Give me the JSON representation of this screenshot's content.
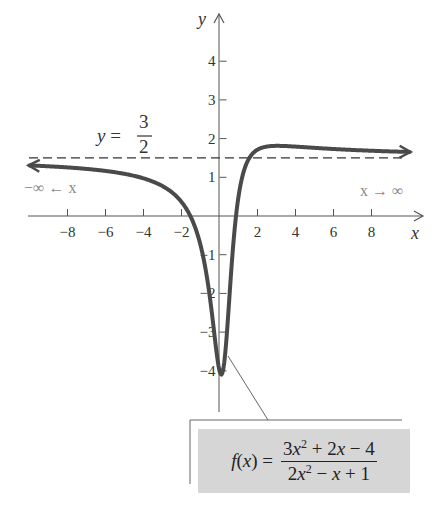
{
  "chart_data": {
    "type": "line",
    "title": "",
    "xlabel": "x",
    "ylabel": "y",
    "xlim": [
      -10,
      10
    ],
    "ylim": [
      -5,
      5
    ],
    "x_ticks": [
      -8,
      -6,
      -4,
      -2,
      2,
      4,
      6,
      8
    ],
    "y_ticks": [
      -4,
      -3,
      -2,
      -1,
      1,
      2,
      3,
      4
    ],
    "x_tick_labels": [
      "−8",
      "−6",
      "−4",
      "−2",
      "2",
      "4",
      "6",
      "8"
    ],
    "y_tick_labels": [
      "−4",
      "−3",
      "−2",
      "−1",
      "1",
      "2",
      "3",
      "4"
    ],
    "grid": false,
    "series": [
      {
        "name": "f(x) = (3x^2 + 2x − 4)/(2x^2 − x + 1)",
        "formula": "(3x^2+2x-4)/(2x^2-x+1)",
        "x": [
          -10,
          -8,
          -6,
          -4,
          -2,
          -1,
          0,
          0.5,
          1,
          2,
          3,
          4,
          6,
          8,
          10
        ],
        "values": [
          1.308,
          1.254,
          1.158,
          0.973,
          0.364,
          -0.75,
          -4.0,
          -1.75,
          0.5,
          1.714,
          1.8,
          1.786,
          1.731,
          1.689,
          1.654
        ],
        "arrows": "both ends"
      }
    ],
    "asymptote": {
      "type": "horizontal",
      "y": 1.5,
      "style": "dashed"
    },
    "annotations": {
      "asymptote_label_lhs": "y =",
      "asymptote_label_num": "3",
      "asymptote_label_den": "2",
      "left_limit": "−∞ ← x",
      "right_limit": "x → ∞"
    }
  },
  "formula_box": {
    "lhs": "f(x) =",
    "numerator": "3x² + 2x − 4",
    "denominator": "2x² − x + 1"
  },
  "colors": {
    "curve": "#4a4a4a",
    "axes": "#555555",
    "box_fill": "#d6d6d6",
    "limit_text": "#8a8a8a"
  }
}
